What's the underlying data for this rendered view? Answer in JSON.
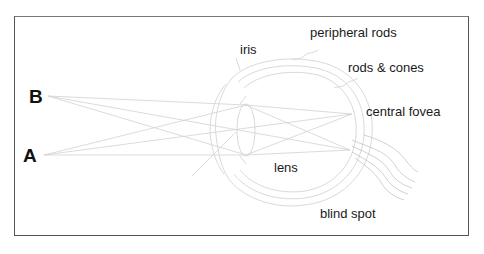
{
  "diagram": {
    "points": [
      {
        "id": "B",
        "label": "B"
      },
      {
        "id": "A",
        "label": "A"
      }
    ],
    "labels": {
      "iris": "iris",
      "peripheral_rods": "peripheral rods",
      "rods_cones": "rods & cones",
      "central_fovea": "central fovea",
      "lens": "lens",
      "blind_spot": "blind spot"
    },
    "colors": {
      "frame": "#555555",
      "lines": "#c8c8c8",
      "text": "#1a1a1a"
    }
  }
}
